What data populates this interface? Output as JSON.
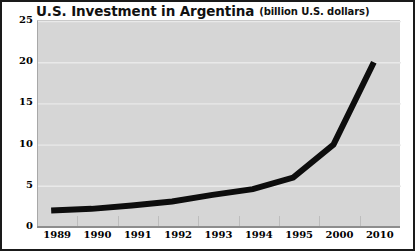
{
  "figure": {
    "width": 415,
    "height": 251,
    "border_color": "#1a1a1a",
    "page_background": "#ffffff"
  },
  "title": {
    "main": "U.S. Investment in Argentina",
    "parenthetical": "(billion U.S. dollars)"
  },
  "colors": {
    "plot_background": "#d6d6d6",
    "gridline": "#e9e9e9",
    "line_series": "#0d0d0d",
    "axis_line": "#8d8d8d",
    "tick_label": "#000000"
  },
  "chart_data": {
    "type": "line",
    "title": "U.S. Investment in Argentina (billion U.S. dollars)",
    "xlabel": "",
    "ylabel": "",
    "unit": "billion U.S. dollars",
    "categories": [
      "1989",
      "1990",
      "1991",
      "1992",
      "1993",
      "1994",
      "1995",
      "2000",
      "2010"
    ],
    "x": [
      "1989",
      "1990",
      "1991",
      "1992",
      "1993",
      "1994",
      "1995",
      "2000",
      "2010"
    ],
    "values": [
      2.0,
      2.2,
      2.6,
      3.1,
      3.9,
      4.6,
      6.0,
      10.0,
      20.0
    ],
    "series": [
      {
        "name": "U.S. Investment in Argentina",
        "values": [
          2.0,
          2.2,
          2.6,
          3.1,
          3.9,
          4.6,
          6.0,
          10.0,
          20.0
        ],
        "color": "#0d0d0d",
        "line_width": 6
      }
    ],
    "ylim": [
      0,
      25
    ],
    "yticks": [
      0,
      5,
      10,
      15,
      20,
      25
    ],
    "ytick_labels": [
      "0",
      "5",
      "10",
      "15",
      "20",
      "25"
    ],
    "xtick_labels": [
      "1989",
      "1990",
      "1991",
      "1992",
      "1993",
      "1994",
      "1995",
      "2000",
      "2010"
    ],
    "grid": true,
    "grid_axis": "y",
    "legend": false,
    "legend_position": "none",
    "markers": false
  }
}
